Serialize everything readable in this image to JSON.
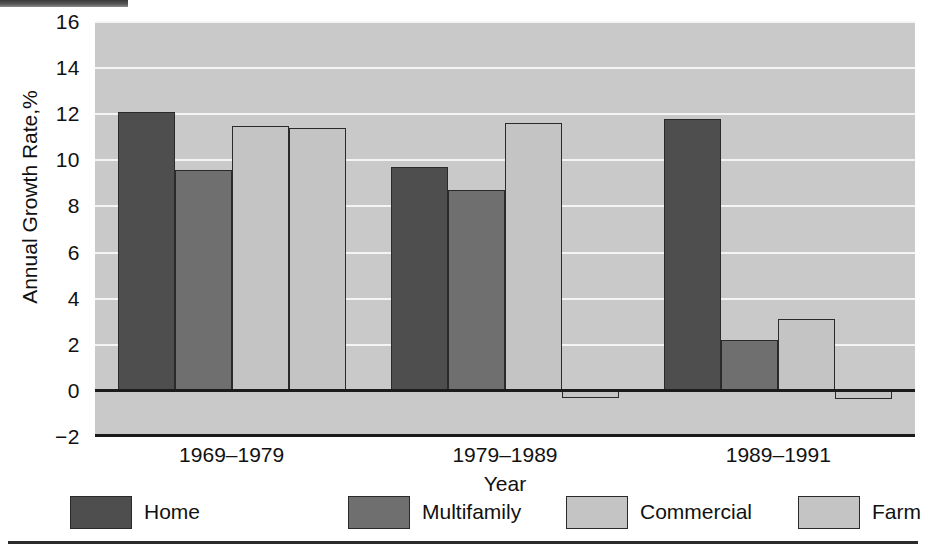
{
  "chart_data": {
    "type": "bar",
    "title": "",
    "xlabel": "Year",
    "ylabel": "Annual Growth Rate,%",
    "categories": [
      "1969–1979",
      "1979–1989",
      "1989–1991"
    ],
    "series": [
      {
        "name": "Home",
        "color": "#4e4e4e",
        "values": [
          12.1,
          9.7,
          11.8
        ]
      },
      {
        "name": "Multifamily",
        "color": "#6f6f6f",
        "values": [
          9.6,
          8.7,
          2.2
        ]
      },
      {
        "name": "Commercial",
        "color": "#c4c4c4",
        "values": [
          11.5,
          11.6,
          3.1
        ]
      },
      {
        "name": "Farm",
        "color": "#c4c4c4",
        "values": [
          11.4,
          -0.3,
          -0.35
        ]
      }
    ],
    "ylim": [
      -2,
      16
    ],
    "yticks": [
      -2,
      0,
      2,
      4,
      6,
      8,
      10,
      12,
      14,
      16
    ],
    "ytick_labels": [
      "−2",
      "0",
      "2",
      "4",
      "6",
      "8",
      "10",
      "12",
      "14",
      "16"
    ],
    "grid": true,
    "grid_color": "#f4f4f4",
    "plot_background": "#c9c9c9",
    "legend_position": "bottom",
    "zero_line": 0
  },
  "axes": {
    "y_title": "Annual Growth Rate,%",
    "x_title": "Year"
  },
  "legend": {
    "items": [
      {
        "label": "Home"
      },
      {
        "label": "Multifamily"
      },
      {
        "label": "Commercial"
      },
      {
        "label": "Farm"
      }
    ]
  }
}
